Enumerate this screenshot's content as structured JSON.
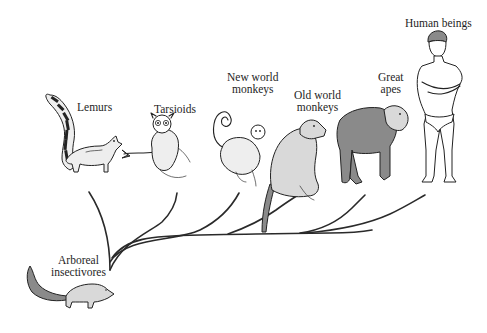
{
  "diagram": {
    "type": "phylogenetic-tree",
    "root": {
      "label_lines": [
        "Arboreal",
        "insectivores"
      ]
    },
    "groups": [
      {
        "id": "lemurs",
        "label_lines": [
          "Lemurs"
        ]
      },
      {
        "id": "tarsioids",
        "label_lines": [
          "Tarsioids"
        ]
      },
      {
        "id": "new-world-monkeys",
        "label_lines": [
          "New world",
          "monkeys"
        ]
      },
      {
        "id": "old-world-monkeys",
        "label_lines": [
          "Old world",
          "monkeys"
        ]
      },
      {
        "id": "great-apes",
        "label_lines": [
          "Great",
          "apes"
        ]
      },
      {
        "id": "human-beings",
        "label_lines": [
          "Human beings"
        ]
      }
    ],
    "colors": {
      "background": "#ffffff",
      "ink": "#222222"
    }
  }
}
